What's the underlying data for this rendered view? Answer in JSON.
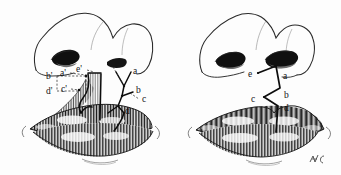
{
  "illustration": {
    "title": "Cleft lip repair — Z-plasty flap design",
    "background_color": "#fdfdfd",
    "ink_color": "#141414",
    "panels": [
      {
        "id": "preoperative",
        "name": "left-panel-preoperative",
        "description": "Unilateral cleft lip with marked triangular flaps and dashed measurement leader lines",
        "labels": [
          {
            "key": "b-prime",
            "text": "b'",
            "x": 49,
            "y": 76
          },
          {
            "key": "a-prime",
            "text": "a'",
            "x": 63,
            "y": 73
          },
          {
            "key": "e-prime",
            "text": "e'",
            "x": 81,
            "y": 70
          },
          {
            "key": "d-prime",
            "text": "d'",
            "x": 49,
            "y": 91
          },
          {
            "key": "c-prime",
            "text": "c'",
            "x": 64,
            "y": 89
          },
          {
            "key": "e",
            "text": "e",
            "x": 118,
            "y": 64
          },
          {
            "key": "a",
            "text": "a",
            "x": 134,
            "y": 72
          },
          {
            "key": "b",
            "text": "b",
            "x": 137,
            "y": 91
          },
          {
            "key": "c",
            "text": "c",
            "x": 143,
            "y": 99
          },
          {
            "key": "d",
            "text": "d",
            "x": 127,
            "y": 111
          }
        ]
      },
      {
        "id": "postoperative",
        "name": "right-panel-postoperative",
        "description": "Repaired lip showing the healed zigzag Z-plasty suture line",
        "labels": [
          {
            "key": "e",
            "text": "e",
            "x": 251,
            "y": 74
          },
          {
            "key": "a",
            "text": "a",
            "x": 284,
            "y": 76
          },
          {
            "key": "b",
            "text": "b",
            "x": 285,
            "y": 95
          },
          {
            "key": "c",
            "text": "c",
            "x": 254,
            "y": 99
          },
          {
            "key": "d",
            "text": "d",
            "x": 285,
            "y": 108
          }
        ]
      }
    ],
    "signature": {
      "text": "✐",
      "x": 316,
      "y": 160
    }
  }
}
